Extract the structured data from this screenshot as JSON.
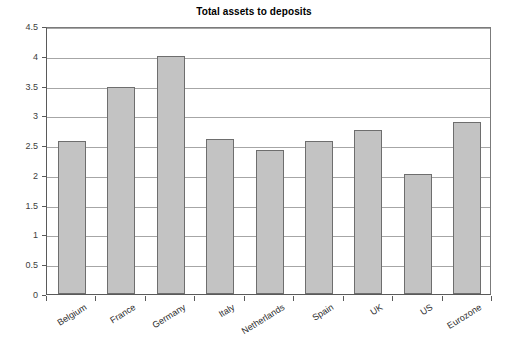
{
  "chart_data": {
    "type": "bar",
    "title": "Total assets to deposits",
    "xlabel": "",
    "ylabel": "",
    "ylim": [
      0,
      4.5
    ],
    "ytick_step": 0.5,
    "grid": true,
    "legend": false,
    "legend_position": "none",
    "categories": [
      "Belgium",
      "France",
      "Germany",
      "Italy",
      "Netherlands",
      "Spain",
      "UK",
      "US",
      "Eurozone"
    ],
    "values": [
      2.57,
      3.48,
      4.0,
      2.6,
      2.42,
      2.57,
      2.75,
      2.02,
      2.88
    ],
    "ytick_labels": [
      "0",
      "0.5",
      "1",
      "1.5",
      "2",
      "2.5",
      "3",
      "3.5",
      "4",
      "4.5"
    ],
    "ytick_values": [
      0,
      0.5,
      1,
      1.5,
      2,
      2.5,
      3,
      3.5,
      4,
      4.5
    ],
    "bar_color": "#c3c3c3",
    "bar_border_color": "#6e6e6e",
    "gridline_color": "#a6a6a6",
    "axis_color": "#5a5a5a",
    "background_color": "#ffffff",
    "text_color": "#000000"
  }
}
